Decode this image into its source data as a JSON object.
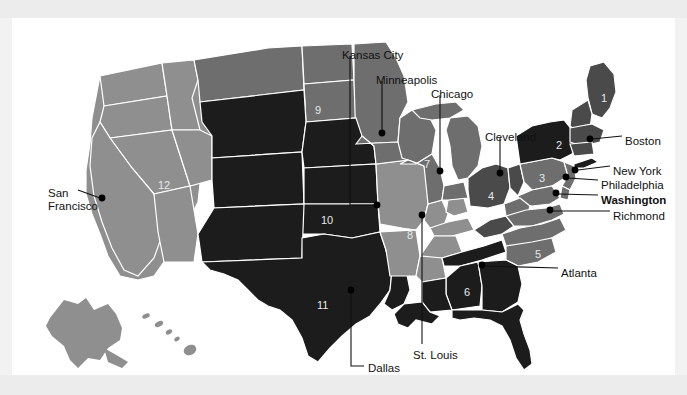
{
  "figure": {
    "kind": "map",
    "panel_background": "#ffffff",
    "page_background": "#f2f2f2"
  },
  "palette": {
    "light_gray": "#8f8f8f",
    "mid_gray": "#6e6e6e",
    "dark_gray": "#4a4a4a",
    "darkest": "#1c1c1c",
    "border": "#ffffff",
    "label_text": "#111111",
    "number_text": "#e8e8e8"
  },
  "district_numbers": [
    {
      "id": "d1",
      "label": "1",
      "x": 589,
      "y": 74,
      "shade": "dark_gray"
    },
    {
      "id": "d2",
      "label": "2",
      "x": 544,
      "y": 121,
      "shade": "darkest"
    },
    {
      "id": "d3",
      "label": "3",
      "x": 527,
      "y": 154,
      "shade": "mid_gray"
    },
    {
      "id": "d4",
      "label": "4",
      "x": 476,
      "y": 172,
      "shade": "dark_gray"
    },
    {
      "id": "d5",
      "label": "5",
      "x": 523,
      "y": 230,
      "shade": "mid_gray"
    },
    {
      "id": "d6",
      "label": "6",
      "x": 452,
      "y": 268,
      "shade": "darkest"
    },
    {
      "id": "d7",
      "label": "7",
      "x": 412,
      "y": 140,
      "shade": "mid_gray"
    },
    {
      "id": "d8",
      "label": "8",
      "x": 395,
      "y": 211,
      "shade": "light_gray"
    },
    {
      "id": "d9",
      "label": "9",
      "x": 303,
      "y": 86,
      "shade": "mid_gray"
    },
    {
      "id": "d10",
      "label": "10",
      "x": 309,
      "y": 196,
      "shade": "darkest"
    },
    {
      "id": "d11",
      "label": "11",
      "x": 305,
      "y": 281,
      "shade": "darkest"
    },
    {
      "id": "d12",
      "label": "12",
      "x": 146,
      "y": 161,
      "shade": "light_gray"
    }
  ],
  "city_labels": [
    {
      "id": "kansas-city",
      "text": "Kansas City",
      "bold": false,
      "x": 330,
      "y": 31,
      "align": "left"
    },
    {
      "id": "minneapolis",
      "text": "Minneapolis",
      "bold": false,
      "x": 364,
      "y": 56,
      "align": "left"
    },
    {
      "id": "chicago",
      "text": "Chicago",
      "bold": false,
      "x": 419,
      "y": 70,
      "align": "left"
    },
    {
      "id": "cleveland",
      "text": "Cleveland",
      "bold": false,
      "x": 473,
      "y": 113,
      "align": "left"
    },
    {
      "id": "boston",
      "text": "Boston",
      "bold": false,
      "x": 613,
      "y": 117,
      "align": "left"
    },
    {
      "id": "new-york",
      "text": "New York",
      "bold": false,
      "x": 601,
      "y": 147,
      "align": "left"
    },
    {
      "id": "philadelphia",
      "text": "Philadelphia",
      "bold": false,
      "x": 589,
      "y": 161,
      "align": "left"
    },
    {
      "id": "washington",
      "text": "Washington",
      "bold": true,
      "x": 589,
      "y": 176,
      "align": "left"
    },
    {
      "id": "richmond",
      "text": "Richmond",
      "bold": false,
      "x": 601,
      "y": 192,
      "align": "left"
    },
    {
      "id": "atlanta",
      "text": "Atlanta",
      "bold": false,
      "x": 549,
      "y": 249,
      "align": "left"
    },
    {
      "id": "san-francisco",
      "text": "San\nFrancisco",
      "bold": false,
      "x": 36,
      "y": 169,
      "align": "left"
    },
    {
      "id": "st-louis",
      "text": "St. Louis",
      "bold": false,
      "x": 401,
      "y": 331,
      "align": "left"
    },
    {
      "id": "dallas",
      "text": "Dallas",
      "bold": false,
      "x": 356,
      "y": 344,
      "align": "left"
    }
  ],
  "city_markers": [
    {
      "id": "minneapolis-dot",
      "x": 370,
      "y": 115
    },
    {
      "id": "kansas-city-dot",
      "x": 365,
      "y": 187
    },
    {
      "id": "chicago-dot",
      "x": 428,
      "y": 153
    },
    {
      "id": "cleveland-dot",
      "x": 488,
      "y": 155
    },
    {
      "id": "boston-dot",
      "x": 578,
      "y": 121
    },
    {
      "id": "new-york-dot",
      "x": 563,
      "y": 152
    },
    {
      "id": "philadelphia-dot",
      "x": 554,
      "y": 159
    },
    {
      "id": "washington-dot",
      "x": 544,
      "y": 175
    },
    {
      "id": "richmond-dot",
      "x": 538,
      "y": 192
    },
    {
      "id": "atlanta-dot",
      "x": 470,
      "y": 247
    },
    {
      "id": "san-francisco-dot",
      "x": 90,
      "y": 180
    },
    {
      "id": "st-louis-dot",
      "x": 410,
      "y": 197
    },
    {
      "id": "dallas-dot",
      "x": 339,
      "y": 272
    }
  ]
}
